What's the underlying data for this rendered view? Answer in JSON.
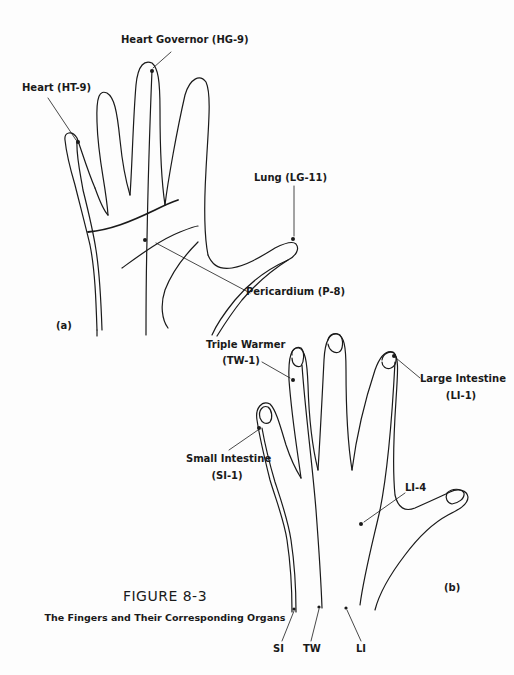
{
  "figure": {
    "number": "FIGURE 8-3",
    "caption": "The Fingers and Their Corresponding Organs"
  },
  "panel_a": {
    "tag": "(a)",
    "labels": {
      "heart_governor": "Heart Governor (HG-9)",
      "heart": "Heart (HT-9)",
      "lung": "Lung (LG-11)",
      "pericardium": "Pericardium (P-8)"
    }
  },
  "panel_b": {
    "tag": "(b)",
    "labels": {
      "triple_warmer_name": "Triple Warmer",
      "triple_warmer_code": "(TW-1)",
      "large_intestine_name": "Large Intestine",
      "large_intestine_code": "(LI-1)",
      "small_intestine_name": "Small Intestine",
      "small_intestine_code": "(SI-1)",
      "li4": "LI-4",
      "meridian_si": "SI",
      "meridian_tw": "TW",
      "meridian_li": "LI"
    }
  }
}
